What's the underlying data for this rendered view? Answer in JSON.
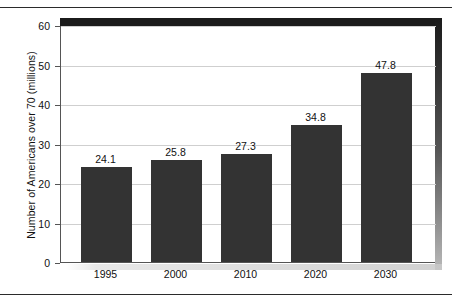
{
  "chart_data": {
    "type": "bar",
    "title": "",
    "subtitle": "",
    "xlabel": "",
    "ylabel": "Number of Americans over 70 (millions)",
    "categories": [
      "1995",
      "2000",
      "2010",
      "2020",
      "2030"
    ],
    "values": [
      24.1,
      25.8,
      27.3,
      34.8,
      47.8
    ],
    "value_labels": [
      "24.1",
      "25.8",
      "27.3",
      "34.8",
      "47.8"
    ],
    "series": [
      {
        "name": "Number of Americans over 70 (millions)",
        "values": [
          24.1,
          25.8,
          27.3,
          34.8,
          47.8
        ]
      }
    ],
    "ylim": [
      0,
      60
    ],
    "yticks": [
      0,
      10,
      20,
      30,
      40,
      50,
      60
    ],
    "ytick_labels": [
      "0",
      "10",
      "20",
      "30",
      "40",
      "50",
      "60"
    ],
    "grid": true,
    "grid_axis": "y",
    "legend": false,
    "legend_position": "none",
    "bar_color": "#333333",
    "gridline_color": "#cfcfcf",
    "axis_color": "#555555",
    "frame_color": "#1b1b1b",
    "background_color": "#ffffff",
    "annotations": []
  }
}
